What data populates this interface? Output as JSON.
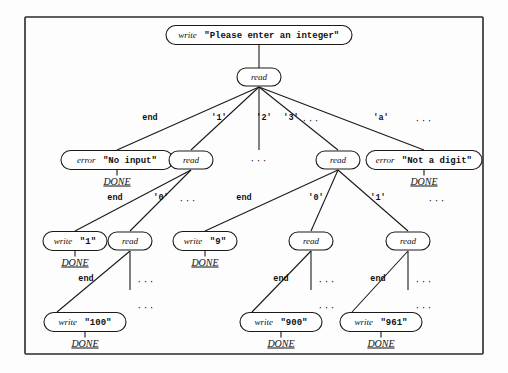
{
  "figure": {
    "kind": "parse-decision-tree",
    "frame": {
      "x": 25,
      "y": 17,
      "width": 458,
      "height": 337
    }
  },
  "tokens": {
    "write": "write",
    "read": "read",
    "error": "error",
    "done": "DONE",
    "ellipsis": "···"
  },
  "nodes": [
    {
      "id": "n-root-write",
      "kw": "write",
      "arg": "\"Please enter an integer\"",
      "cx": 259,
      "cy": 35,
      "w": 186,
      "h": 19,
      "done": ""
    },
    {
      "id": "n-root-read",
      "kw": "read",
      "arg": "",
      "cx": 259,
      "cy": 77,
      "w": 44,
      "h": 18,
      "done": ""
    },
    {
      "id": "n-l2-err-noinput",
      "kw": "error",
      "arg": "\"No input\"",
      "cx": 117,
      "cy": 160,
      "w": 112,
      "h": 19,
      "done": "DONE"
    },
    {
      "id": "n-l2-read-1",
      "kw": "read",
      "arg": "",
      "cx": 191,
      "cy": 160,
      "w": 44,
      "h": 18,
      "done": ""
    },
    {
      "id": "n-l2-read-3",
      "kw": "read",
      "arg": "",
      "cx": 338,
      "cy": 160,
      "w": 44,
      "h": 18,
      "done": ""
    },
    {
      "id": "n-l2-err-digit",
      "kw": "error",
      "arg": "\"Not a digit\"",
      "cx": 424,
      "cy": 160,
      "w": 116,
      "h": 19,
      "done": "DONE"
    },
    {
      "id": "n-l3-write-1",
      "kw": "write",
      "arg": "\"1\"",
      "cx": 75,
      "cy": 241,
      "w": 64,
      "h": 19,
      "done": "DONE"
    },
    {
      "id": "n-l3-read-10",
      "kw": "read",
      "arg": "",
      "cx": 130,
      "cy": 241,
      "w": 44,
      "h": 18,
      "done": ""
    },
    {
      "id": "n-l3-write-9",
      "kw": "write",
      "arg": "\"9\"",
      "cx": 205,
      "cy": 241,
      "w": 64,
      "h": 19,
      "done": "DONE"
    },
    {
      "id": "n-l3-read-90",
      "kw": "read",
      "arg": "",
      "cx": 311,
      "cy": 241,
      "w": 44,
      "h": 18,
      "done": ""
    },
    {
      "id": "n-l3-read-96",
      "kw": "read",
      "arg": "",
      "cx": 408,
      "cy": 241,
      "w": 44,
      "h": 18,
      "done": ""
    },
    {
      "id": "n-l4-write-100",
      "kw": "write",
      "arg": "\"100\"",
      "cx": 85,
      "cy": 322,
      "w": 82,
      "h": 19,
      "done": "DONE"
    },
    {
      "id": "n-l4-write-900",
      "kw": "write",
      "arg": "\"900\"",
      "cx": 281,
      "cy": 322,
      "w": 82,
      "h": 19,
      "done": "DONE"
    },
    {
      "id": "n-l4-write-961",
      "kw": "write",
      "arg": "\"961\"",
      "cx": 381,
      "cy": 322,
      "w": 82,
      "h": 19,
      "done": "DONE"
    }
  ],
  "edges": [
    {
      "id": "e-root",
      "x1": 259,
      "y1": 45,
      "x2": 259,
      "y2": 68,
      "label": "",
      "lx": 0,
      "ly": 0
    },
    {
      "id": "e-end-1",
      "x1": 259,
      "y1": 87,
      "x2": 117,
      "y2": 150,
      "label": "end",
      "lx": 150,
      "ly": 120
    },
    {
      "id": "e-1",
      "x1": 259,
      "y1": 87,
      "x2": 191,
      "y2": 150,
      "label": "'1'",
      "lx": 219,
      "ly": 120
    },
    {
      "id": "e-2",
      "x1": 259,
      "y1": 87,
      "x2": 259,
      "y2": 150,
      "label": "'2'",
      "lx": 264,
      "ly": 120
    },
    {
      "id": "e-3",
      "x1": 259,
      "y1": 87,
      "x2": 338,
      "y2": 150,
      "label": "'3'",
      "lx": 291,
      "ly": 120
    },
    {
      "id": "e-a",
      "x1": 259,
      "y1": 87,
      "x2": 424,
      "y2": 150,
      "label": "'a'",
      "lx": 381,
      "ly": 120
    },
    {
      "id": "e-end-2",
      "x1": 191,
      "y1": 170,
      "x2": 75,
      "y2": 231,
      "label": "end",
      "lx": 115,
      "ly": 200
    },
    {
      "id": "e-0a",
      "x1": 191,
      "y1": 170,
      "x2": 130,
      "y2": 231,
      "label": "'0'",
      "lx": 161,
      "ly": 200
    },
    {
      "id": "e-end-3",
      "x1": 338,
      "y1": 170,
      "x2": 205,
      "y2": 231,
      "label": "end",
      "lx": 244,
      "ly": 200
    },
    {
      "id": "e-0b",
      "x1": 338,
      "y1": 170,
      "x2": 311,
      "y2": 231,
      "label": "'0'",
      "lx": 316,
      "ly": 200
    },
    {
      "id": "e-1b",
      "x1": 338,
      "y1": 170,
      "x2": 408,
      "y2": 231,
      "label": "'1'",
      "lx": 378,
      "ly": 200
    },
    {
      "id": "e-end-4",
      "x1": 130,
      "y1": 251,
      "x2": 57,
      "y2": 312,
      "label": "end",
      "lx": 86,
      "ly": 281
    },
    {
      "id": "e-dots-a",
      "x1": 130,
      "y1": 251,
      "x2": 130,
      "y2": 290,
      "label": "",
      "lx": 0,
      "ly": 0
    },
    {
      "id": "e-end-5",
      "x1": 311,
      "y1": 251,
      "x2": 252,
      "y2": 312,
      "label": "end",
      "lx": 281,
      "ly": 281
    },
    {
      "id": "e-dots-b",
      "x1": 311,
      "y1": 251,
      "x2": 311,
      "y2": 290,
      "label": "",
      "lx": 0,
      "ly": 0
    },
    {
      "id": "e-end-6",
      "x1": 408,
      "y1": 251,
      "x2": 352,
      "y2": 312,
      "label": "end",
      "lx": 378,
      "ly": 281
    },
    {
      "id": "e-dots-c",
      "x1": 408,
      "y1": 251,
      "x2": 408,
      "y2": 290,
      "label": "",
      "lx": 0,
      "ly": 0
    }
  ],
  "ellipses": [
    {
      "id": "el-after-3",
      "text": "···",
      "x": 311,
      "y": 123
    },
    {
      "id": "el-after-a",
      "text": "···",
      "x": 424,
      "y": 123
    },
    {
      "id": "el-under-2",
      "text": "···",
      "x": 259,
      "y": 163
    },
    {
      "id": "el-l3-left",
      "text": "···",
      "x": 188,
      "y": 203
    },
    {
      "id": "el-l3-right",
      "text": "···",
      "x": 437,
      "y": 203
    },
    {
      "id": "el-l4-a1",
      "text": "···",
      "x": 146,
      "y": 284
    },
    {
      "id": "el-l4-a2",
      "text": "···",
      "x": 146,
      "y": 310
    },
    {
      "id": "el-l4-b1",
      "text": "···",
      "x": 327,
      "y": 284
    },
    {
      "id": "el-l4-b2",
      "text": "···",
      "x": 327,
      "y": 310
    },
    {
      "id": "el-l4-c1",
      "text": "···",
      "x": 424,
      "y": 284
    },
    {
      "id": "el-l4-c2",
      "text": "···",
      "x": 424,
      "y": 310
    }
  ]
}
